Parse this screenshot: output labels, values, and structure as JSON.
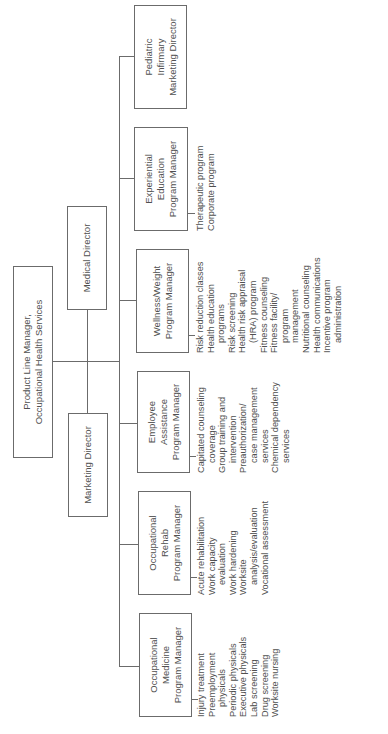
{
  "chart": {
    "root": {
      "line1": "Product Line Manager,",
      "line2": "Occupational Health Services"
    },
    "directors": [
      {
        "label": "Medical Director"
      },
      {
        "label": "Marketing Director"
      }
    ],
    "managers": [
      {
        "lines": [
          "Occupational",
          "Medicine",
          "Program Manager"
        ],
        "items": [
          [
            "Injury treatment"
          ],
          [
            "Preemployment",
            "physicals"
          ],
          [
            "Periodic physicals"
          ],
          [
            "Executive physicals"
          ],
          [
            "Lab screening"
          ],
          [
            "Drug screening"
          ],
          [
            "Worksite nursing"
          ]
        ]
      },
      {
        "lines": [
          "Occupational",
          "Rehab",
          "Program Manager"
        ],
        "items": [
          [
            "Acute rehabilitation"
          ],
          [
            "Work capacity",
            "evaluation"
          ],
          [
            "Work hardening"
          ],
          [
            "Worksite",
            "analysis/evaluation"
          ],
          [
            "Vocational assessment"
          ]
        ]
      },
      {
        "lines": [
          "Employee",
          "Assistance",
          "Program Manager"
        ],
        "items": [
          [
            "Capitated counseling",
            "coverage"
          ],
          [
            "Group training and",
            "intervention"
          ],
          [
            "Preauthorization/",
            "case management",
            "services"
          ],
          [
            "Chemical dependency",
            "services"
          ]
        ]
      },
      {
        "lines": [
          "Wellness/Weight",
          "Program Manager"
        ],
        "items": [
          [
            "Risk reduction classes"
          ],
          [
            "Health education",
            "programs"
          ],
          [
            "Risk screening"
          ],
          [
            "Health risk appraisal",
            "(HRA) program"
          ],
          [
            "Fitness counseling"
          ],
          [
            "Fitness facility/",
            "program",
            "management"
          ],
          [
            "Nutritional counseling"
          ],
          [
            "Health communications"
          ],
          [
            "Incentive program",
            "administration"
          ]
        ]
      },
      {
        "lines": [
          "Experiential",
          "Education",
          "Program Manager"
        ],
        "items": [
          [
            "Therapeutic program"
          ],
          [
            "Corporate program"
          ]
        ]
      },
      {
        "lines": [
          "Pediatric",
          "Infirmary",
          "Marketing Director"
        ],
        "items": []
      }
    ]
  },
  "colors": {
    "line": "#6b6b6b",
    "text": "#505050",
    "background": "#ffffff"
  }
}
